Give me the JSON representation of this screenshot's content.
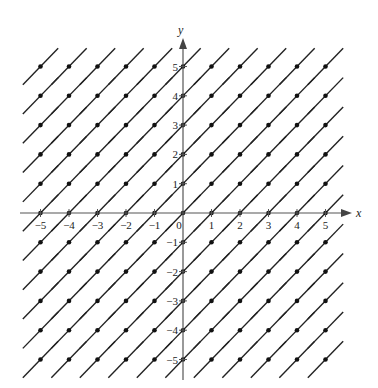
{
  "diagram": {
    "type": "direction_field",
    "slope": 1,
    "x_label": "x",
    "y_label": "y",
    "x_range": [
      -5,
      5
    ],
    "y_range": [
      -5,
      5
    ],
    "x_tick_labels": [
      "-5",
      "-4",
      "-3",
      "-2",
      "-1",
      "0",
      "1",
      "2",
      "3",
      "4",
      "5"
    ],
    "y_tick_labels": [
      "5",
      "4",
      "3",
      "2",
      "1",
      "-1",
      "-2",
      "-3",
      "-4",
      "-5"
    ],
    "origin_label": "0",
    "colors": {
      "axis": "#555555",
      "segment": "#222222",
      "dot": "#111111"
    }
  }
}
